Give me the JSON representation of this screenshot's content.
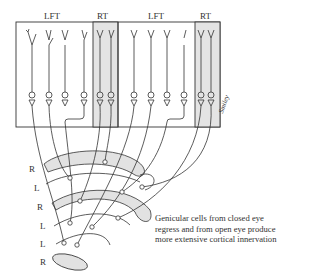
{
  "figure": {
    "column_labels": [
      "LFT",
      "RT",
      "LFT",
      "RT"
    ],
    "layer_labels": [
      "R",
      "L",
      "R",
      "L",
      "L",
      "R"
    ],
    "caption": "Genicular cells from closed eye regress and from open eye produce more extensive cortical innervation",
    "signature": "Smiley",
    "colors": {
      "line": "#333333",
      "shaded": "#e2e2e2",
      "background": "#ffffff"
    }
  }
}
